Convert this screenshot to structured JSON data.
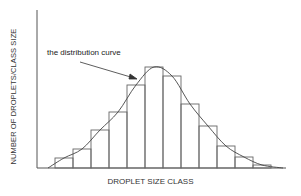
{
  "chart_data": {
    "type": "bar",
    "title": "",
    "xlabel": "DROPLET SIZE CLASS",
    "ylabel": "NUMBER OF DROPLETS/CLASS SIZE",
    "annotation": "the distribution curve",
    "categories": [
      "1",
      "2",
      "3",
      "4",
      "5",
      "6",
      "7",
      "8",
      "9",
      "10",
      "11",
      "12"
    ],
    "values": [
      10,
      19,
      38,
      56,
      83,
      101,
      92,
      64,
      42,
      22,
      11,
      3
    ],
    "curve": "smooth bell-shaped distribution curve overlaid on histogram",
    "grid": false,
    "ticks": false
  },
  "colors": {
    "line": "#555555",
    "text": "#333333",
    "background": "#ffffff"
  }
}
